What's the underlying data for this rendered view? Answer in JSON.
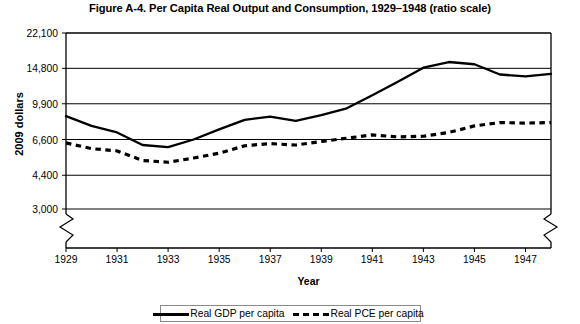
{
  "chart_data": {
    "type": "line",
    "title": "Figure A-4. Per Capita Real Output and Consumption, 1929–1948 (ratio scale)",
    "xlabel": "Year",
    "ylabel": "2009 dollars",
    "scale": "log",
    "grid": true,
    "legend_position": "bottom",
    "ylim": [
      3000,
      22100
    ],
    "xlim": [
      1929,
      1948
    ],
    "ytick_labels": [
      "22,100",
      "14,800",
      "9,900",
      "6,600",
      "4,400",
      "3,000"
    ],
    "ytick_values": [
      22100,
      14800,
      9900,
      6600,
      4400,
      3000
    ],
    "xtick_labels": [
      "1929",
      "1931",
      "1933",
      "1935",
      "1937",
      "1939",
      "1941",
      "1943",
      "1945",
      "1947"
    ],
    "xtick_values": [
      1929,
      1931,
      1933,
      1935,
      1937,
      1939,
      1941,
      1943,
      1945,
      1947
    ],
    "axis_break": true,
    "x": [
      1929,
      1930,
      1931,
      1932,
      1933,
      1934,
      1935,
      1936,
      1937,
      1938,
      1939,
      1940,
      1941,
      1942,
      1943,
      1944,
      1945,
      1946,
      1947,
      1948
    ],
    "series": [
      {
        "name": "Real GDP per capita",
        "style": "solid",
        "color": "#000000",
        "values": [
          8600,
          7700,
          7150,
          6200,
          6050,
          6600,
          7400,
          8250,
          8550,
          8150,
          8700,
          9400,
          10900,
          12700,
          14900,
          15900,
          15500,
          13800,
          13500,
          13900
        ]
      },
      {
        "name": "Real PCE per capita",
        "style": "dashed",
        "color": "#000000",
        "values": [
          6350,
          5950,
          5800,
          5200,
          5100,
          5350,
          5650,
          6150,
          6300,
          6200,
          6450,
          6700,
          6950,
          6800,
          6850,
          7150,
          7700,
          8000,
          7950,
          8000
        ]
      }
    ]
  },
  "legend": {
    "entries": [
      {
        "label": "Real GDP per capita"
      },
      {
        "label": "Real PCE per capita"
      }
    ]
  }
}
